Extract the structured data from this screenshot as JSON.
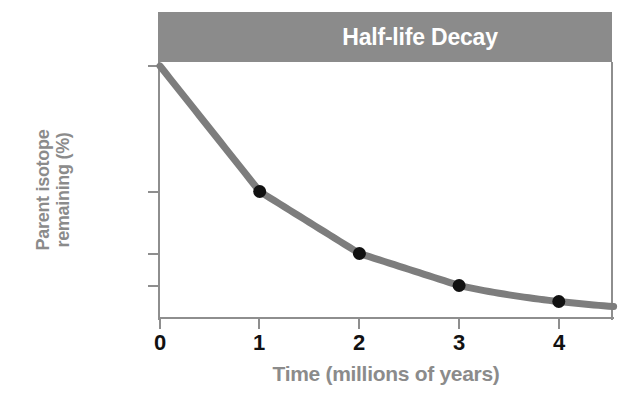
{
  "chart_data": {
    "type": "line",
    "title": "Half-life Decay",
    "xlabel": "Time (millions of years)",
    "ylabel_lines": [
      "Parent isotope",
      "remaining (%)"
    ],
    "ylabel": "Parent isotope remaining (%)",
    "xlim": [
      0,
      4.55
    ],
    "ylim": [
      0,
      100
    ],
    "y_scale": "log2-like (half-life spacing)",
    "grid": false,
    "legend": null,
    "xticks": [
      {
        "value": 0,
        "label": "0"
      },
      {
        "value": 1,
        "label": "1"
      },
      {
        "value": 2,
        "label": "2"
      },
      {
        "value": 3,
        "label": "3"
      },
      {
        "value": 4,
        "label": "4"
      }
    ],
    "yticks": [
      {
        "value": 100,
        "label": "100"
      },
      {
        "value": 50,
        "label": "50"
      },
      {
        "value": 25,
        "label": "25"
      },
      {
        "value": 12.5,
        "label": "12.5"
      }
    ],
    "series": [
      {
        "name": "Parent isotope remaining",
        "color": "#7d7d7d",
        "marker_color": "#111111",
        "x": [
          0,
          1,
          2,
          3,
          4
        ],
        "values": [
          100,
          50,
          25,
          12.5,
          6.25
        ],
        "markers_shown_at_x": [
          1,
          2,
          3,
          4
        ]
      }
    ],
    "colors": {
      "banner": "#8b8b8b",
      "title_text": "#ffffff",
      "axis": "#8e8e8e",
      "axis_label": "#8b8b8b",
      "tick_label": "#111111",
      "curve": "#7d7d7d",
      "marker": "#111111",
      "background": "#ffffff"
    }
  },
  "banner": {
    "title": "Half-life Decay"
  },
  "axes": {
    "x_title": "Time (millions of years)",
    "y_title_line1": "Parent isotope",
    "y_title_line2": "remaining (%)",
    "x_labels": [
      "0",
      "1",
      "2",
      "3",
      "4"
    ],
    "y_labels": [
      "100",
      "50",
      "25",
      "12.5"
    ]
  }
}
